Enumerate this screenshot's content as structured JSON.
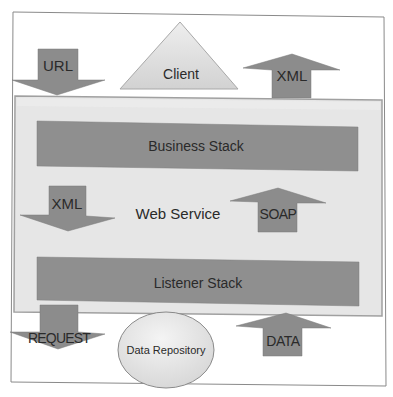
{
  "diagram": {
    "title": "Web Service",
    "colors": {
      "frame_border": "#8a8a8a",
      "panel_fill": "#e6e6e6",
      "panel_border": "#a0a0a0",
      "stack_fill": "#8f8f8f",
      "arrow_fill": "#8c8c8c",
      "triangle_fill": "#dadada",
      "ellipse_fill": "#e4e4e4",
      "text": "#2a2a2a"
    },
    "top": {
      "url_arrow": {
        "label": "URL",
        "direction": "down"
      },
      "client": {
        "label": "Client",
        "shape": "triangle"
      },
      "xml_arrow": {
        "label": "XML",
        "direction": "up"
      }
    },
    "panel": {
      "label": "Web Service",
      "business_stack": {
        "label": "Business Stack"
      },
      "xml_arrow": {
        "label": "XML",
        "direction": "down"
      },
      "soap_arrow": {
        "label": "SOAP",
        "direction": "up"
      },
      "listener_stack": {
        "label": "Listener Stack"
      }
    },
    "bottom": {
      "request_arrow": {
        "label": "REQUEST",
        "direction": "down"
      },
      "data_repository": {
        "label": "Data Repository",
        "shape": "ellipse"
      },
      "data_arrow": {
        "label": "DATA",
        "direction": "up"
      }
    }
  }
}
